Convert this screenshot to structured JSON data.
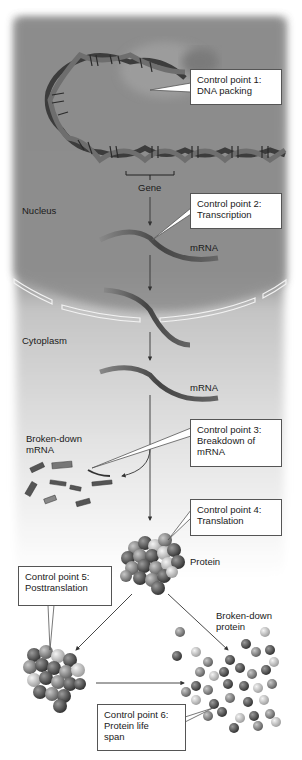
{
  "figure": {
    "palette": {
      "nucleus_bg": "#8c8c8c",
      "cytoplasm_bg": "#d9d9d9",
      "page_bg": "#ffffff",
      "callout_bg": "#ffffff",
      "callout_border": "#555555",
      "text": "#1a1a1a",
      "strand_dark": "#3a3a3a",
      "strand_mid": "#7a7a7a"
    },
    "regions": {
      "nucleus": "Nucleus",
      "cytoplasm": "Cytoplasm"
    },
    "labels": {
      "gene": "Gene",
      "mrna_nucleus": "mRNA",
      "mrna_cytoplasm": "mRNA",
      "broken_mrna_line1": "Broken-down",
      "broken_mrna_line2": "mRNA",
      "protein": "Protein",
      "broken_protein_line1": "Broken-down",
      "broken_protein_line2": "protein"
    },
    "control_points": [
      {
        "id": 1,
        "line1": "Control point 1:",
        "line2": "DNA packing",
        "line3": ""
      },
      {
        "id": 2,
        "line1": "Control point 2:",
        "line2": "Transcription",
        "line3": ""
      },
      {
        "id": 3,
        "line1": "Control point 3:",
        "line2": "Breakdown of",
        "line3": "mRNA"
      },
      {
        "id": 4,
        "line1": "Control point 4:",
        "line2": "Translation",
        "line3": ""
      },
      {
        "id": 5,
        "line1": "Control point 5:",
        "line2": "Posttranslation",
        "line3": ""
      },
      {
        "id": 6,
        "line1": "Control point 6:",
        "line2": "Protein life",
        "line3": "span"
      }
    ]
  }
}
